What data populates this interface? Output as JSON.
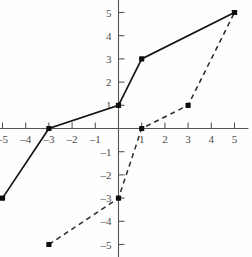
{
  "chart_data": {
    "type": "line",
    "title": "",
    "subtitle": "",
    "xlabel": "",
    "ylabel": "",
    "xlim": [
      -5.6,
      5.6
    ],
    "ylim": [
      -5.6,
      5.6
    ],
    "grid": false,
    "legend": "none",
    "axis_style": "cartesian-cross",
    "x_ticks": [
      -5,
      -4,
      -3,
      -2,
      -1,
      1,
      2,
      3,
      4,
      5
    ],
    "y_ticks": [
      5,
      4,
      3,
      2,
      1,
      -1,
      -2,
      -3,
      -4,
      -5
    ],
    "x_tick_labels": [
      "–5",
      "–4",
      "–3",
      "–2",
      "–1",
      "1",
      "2",
      "3",
      "4",
      "5"
    ],
    "y_tick_labels": [
      "5",
      "4",
      "3",
      "2",
      "1",
      "–1",
      "–2",
      "–3",
      "–4",
      "–5"
    ],
    "series": [
      {
        "name": "solid-function",
        "style": "solid",
        "color": "#131313",
        "markers": true,
        "points": [
          [
            -5,
            -3
          ],
          [
            -3,
            0
          ],
          [
            0,
            1
          ],
          [
            1,
            3
          ],
          [
            5,
            5
          ]
        ]
      },
      {
        "name": "dashed-inverse",
        "style": "dashed",
        "color": "#2a2a2a",
        "markers": true,
        "points": [
          [
            -3,
            -5
          ],
          [
            0,
            -3
          ],
          [
            1,
            0
          ],
          [
            3,
            1
          ],
          [
            5,
            5
          ]
        ]
      }
    ]
  },
  "figure": {
    "background_color": "#fffefe",
    "axis_color": "#555555",
    "label_color": "#4a4a4a"
  }
}
